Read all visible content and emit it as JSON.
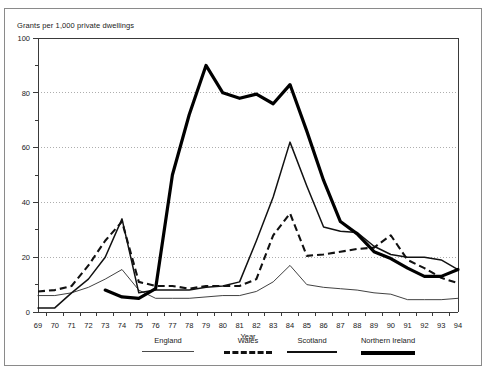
{
  "chart_data": {
    "type": "line",
    "title": "",
    "ylabel": "Grants per 1,000 private dwellings",
    "xlabel": "Year",
    "ylim": [
      0,
      100
    ],
    "yticks": [
      0,
      20,
      40,
      60,
      80,
      100
    ],
    "yticks_minor": [
      10,
      30,
      50,
      70,
      90
    ],
    "grid": "horizontal-dotted",
    "legend_position": "bottom",
    "categories": [
      "69",
      "70",
      "71",
      "72",
      "73",
      "74",
      "75",
      "76",
      "77",
      "78",
      "79",
      "80",
      "81",
      "82",
      "83",
      "84",
      "85",
      "86",
      "87",
      "88",
      "89",
      "90",
      "91",
      "92",
      "93",
      "94"
    ],
    "x": [
      1969,
      1970,
      1971,
      1972,
      1973,
      1974,
      1975,
      1976,
      1977,
      1978,
      1979,
      1980,
      1981,
      1982,
      1983,
      1984,
      1985,
      1986,
      1987,
      1988,
      1989,
      1990,
      1991,
      1992,
      1993,
      1994
    ],
    "series": [
      {
        "name": "England",
        "style": "thin-solid",
        "color": "#2b2b2b",
        "values": [
          6,
          6,
          7,
          9,
          12,
          15.5,
          8,
          5,
          5,
          5,
          5.5,
          6,
          6,
          7.5,
          11,
          17,
          10,
          9,
          8.5,
          8,
          7,
          6.5,
          4.5,
          4.5,
          4.5,
          5
        ]
      },
      {
        "name": "Wales",
        "style": "dashed",
        "color": "#111111",
        "values": [
          7.5,
          8,
          9.5,
          17,
          26,
          33,
          11,
          9.5,
          9.5,
          8.5,
          9.5,
          9.5,
          9.5,
          12,
          28,
          36,
          20.5,
          21,
          22,
          23,
          23.5,
          28,
          19,
          16,
          12.5,
          10.5
        ]
      },
      {
        "name": "Scotland",
        "style": "medium-solid",
        "color": "#111111",
        "values": [
          1.5,
          1.5,
          7,
          12,
          20,
          34,
          7,
          8,
          8,
          8,
          9,
          9.5,
          11,
          26,
          42,
          62,
          46,
          31,
          29.5,
          29,
          24,
          21,
          20,
          20,
          19,
          15.5
        ]
      },
      {
        "name": "Northern Ireland",
        "style": "thick-solid",
        "color": "#000000",
        "values": [
          null,
          null,
          null,
          null,
          8,
          5.5,
          5,
          8.5,
          50,
          72,
          90,
          80,
          78,
          79.5,
          76,
          83,
          66,
          48,
          33,
          28.5,
          22,
          19.5,
          16,
          13,
          13,
          15.5
        ]
      }
    ]
  },
  "legend": {
    "items": [
      {
        "label": "England",
        "key": "thin-solid"
      },
      {
        "label": "Wales",
        "key": "dashed"
      },
      {
        "label": "Scotland",
        "key": "medium-solid"
      },
      {
        "label": "Northern Ireland",
        "key": "thick-solid"
      }
    ]
  }
}
